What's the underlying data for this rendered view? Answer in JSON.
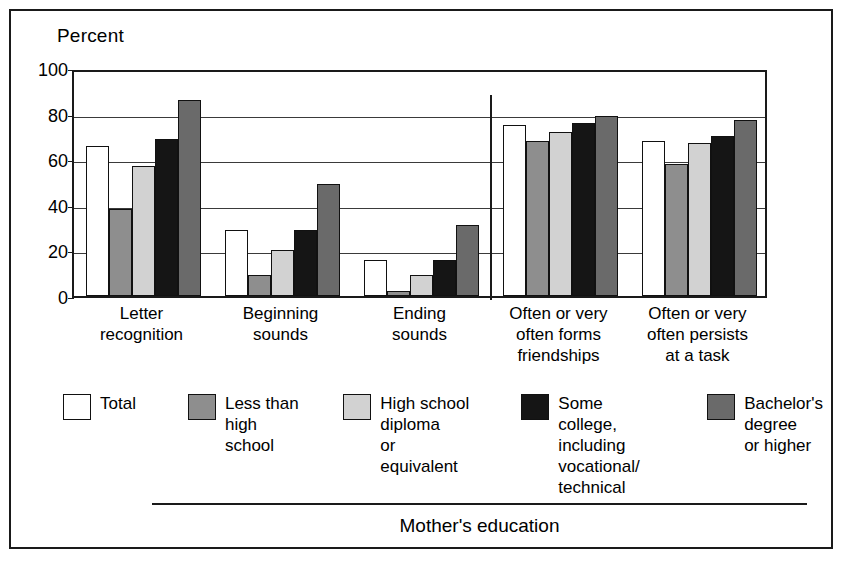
{
  "figure": {
    "y_axis_title": "Percent",
    "footer_label": "Mother's education"
  },
  "chart_data": {
    "type": "bar",
    "title": "",
    "subtitle": "",
    "xlabel": "Mother's education",
    "ylabel": "Percent",
    "ylim": [
      0,
      100
    ],
    "yticks": [
      0,
      20,
      40,
      60,
      80,
      100
    ],
    "grid": "horizontal",
    "legend_position": "below-plot",
    "orientation": "vertical",
    "grouped": true,
    "categories": [
      "Letter recognition",
      "Beginning sounds",
      "Ending sounds",
      "Often or very often forms friendships",
      "Often or very often persists at a task"
    ],
    "category_lines": [
      [
        "Letter",
        "recognition"
      ],
      [
        "Beginning",
        "sounds"
      ],
      [
        "Ending",
        "sounds"
      ],
      [
        "Often or very",
        "often forms",
        "friendships"
      ],
      [
        "Often or very",
        "often persists",
        "at a task"
      ]
    ],
    "series": [
      {
        "name": "Total",
        "color": "#ffffff",
        "values": [
          66,
          29,
          16,
          75,
          68
        ]
      },
      {
        "name": "Less than high school",
        "color": "#8e8e8e",
        "values": [
          38,
          9,
          2,
          68,
          58
        ]
      },
      {
        "name": "High school diploma or equivalent",
        "color": "#d2d2d2",
        "values": [
          57,
          20,
          9,
          72,
          67
        ]
      },
      {
        "name": "Some college, including vocational/technical",
        "color": "#151515",
        "values": [
          69,
          29,
          16,
          76,
          70
        ]
      },
      {
        "name": "Bachelor's degree or higher",
        "color": "#6a6a6a",
        "values": [
          86,
          49,
          31,
          79,
          77
        ]
      }
    ],
    "annotations": [
      {
        "type": "vertical-divider",
        "between_categories": [
          "Ending sounds",
          "Often or very often forms friendships"
        ],
        "from_value": 0,
        "to_value": 90
      }
    ]
  },
  "legend": {
    "items": [
      {
        "label": "Total",
        "swatch": "legend-swatch-total"
      },
      {
        "label": "Less than\nhigh school",
        "swatch": "legend-swatch-less-than-high-school"
      },
      {
        "label": "High school\ndiploma\nor equivalent",
        "swatch": "legend-swatch-high-school-diploma"
      },
      {
        "label": "Some college,\nincluding\nvocational/\ntechnical",
        "swatch": "legend-swatch-some-college"
      },
      {
        "label": "Bachelor's\ndegree\nor higher",
        "swatch": "legend-swatch-bachelors-degree"
      }
    ]
  }
}
